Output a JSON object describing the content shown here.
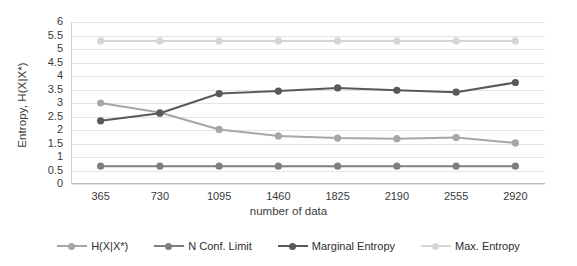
{
  "chart_data": {
    "type": "line",
    "title": "",
    "xlabel": "number of data",
    "ylabel": "Entropy, H(X|X*)",
    "x": [
      365,
      730,
      1095,
      1460,
      1825,
      2190,
      2555,
      2920
    ],
    "xticklabels": [
      "365",
      "730",
      "1095",
      "1460",
      "1825",
      "2190",
      "2555",
      "2920"
    ],
    "yticklabels": [
      "6",
      "5.5",
      "5",
      "4.5",
      "4",
      "3.5",
      "3",
      "2.5",
      "2",
      "1.5",
      "1",
      "0.5",
      "0"
    ],
    "ylim": [
      0,
      6
    ],
    "ytick_step": 0.5,
    "grid": "horizontal",
    "legend_position": "bottom",
    "series": [
      {
        "name": "H(X|X*)",
        "color": "#a6a6a6",
        "values": [
          3.0,
          2.65,
          2.02,
          1.78,
          1.7,
          1.68,
          1.72,
          1.52
        ]
      },
      {
        "name": "N Conf. Limit",
        "color": "#7f7f7f",
        "values": [
          0.66,
          0.66,
          0.66,
          0.66,
          0.66,
          0.66,
          0.66,
          0.66
        ]
      },
      {
        "name": "Marginal Entropy",
        "color": "#595959",
        "values": [
          2.34,
          2.62,
          3.35,
          3.44,
          3.56,
          3.47,
          3.4,
          3.76
        ]
      },
      {
        "name": "Max. Entropy",
        "color": "#d6d6d6",
        "values": [
          5.3,
          5.3,
          5.3,
          5.3,
          5.3,
          5.3,
          5.3,
          5.3
        ]
      }
    ]
  },
  "axes": {
    "gridline_color": "#e4e4e4",
    "axis_color": "#bdbdbd"
  }
}
